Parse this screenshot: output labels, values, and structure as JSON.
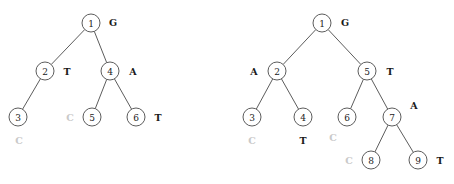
{
  "figure": {
    "colors": {
      "stroke": "#4a4a4a",
      "node_fill": "#ffffff",
      "label_dark": "#1a1a1a",
      "label_light": "#c9c9c9",
      "background": "#ffffff"
    },
    "node_radius": 9
  },
  "chart_data": {
    "type": "diagram",
    "title": "",
    "trees": [
      {
        "name": "left-tree",
        "nodes": [
          {
            "id": "1",
            "x": 91,
            "y": 23,
            "label": "G",
            "label_x": 113,
            "label_y": 22,
            "label_color": "dark"
          },
          {
            "id": "2",
            "x": 45,
            "y": 71,
            "label": "T",
            "label_x": 67,
            "label_y": 71,
            "label_color": "dark"
          },
          {
            "id": "4",
            "x": 110,
            "y": 71,
            "label": "A",
            "label_x": 133,
            "label_y": 71,
            "label_color": "dark"
          },
          {
            "id": "3",
            "x": 18,
            "y": 117,
            "label": "C",
            "label_x": 19,
            "label_y": 140,
            "label_color": "light"
          },
          {
            "id": "5",
            "x": 92,
            "y": 117,
            "label": "C",
            "label_x": 70,
            "label_y": 117,
            "label_color": "light"
          },
          {
            "id": "6",
            "x": 136,
            "y": 117,
            "label": "T",
            "label_x": 158,
            "label_y": 117,
            "label_color": "dark"
          }
        ],
        "edges": [
          {
            "from": "1",
            "to": "2"
          },
          {
            "from": "1",
            "to": "4"
          },
          {
            "from": "2",
            "to": "3"
          },
          {
            "from": "4",
            "to": "5"
          },
          {
            "from": "4",
            "to": "6"
          }
        ]
      },
      {
        "name": "right-tree",
        "nodes": [
          {
            "id": "1",
            "x": 322,
            "y": 23,
            "label": "G",
            "label_x": 345,
            "label_y": 22,
            "label_color": "dark"
          },
          {
            "id": "2",
            "x": 277,
            "y": 71,
            "label": "A",
            "label_x": 254,
            "label_y": 71,
            "label_color": "dark"
          },
          {
            "id": "5",
            "x": 367,
            "y": 71,
            "label": "T",
            "label_x": 390,
            "label_y": 71,
            "label_color": "dark"
          },
          {
            "id": "3",
            "x": 252,
            "y": 117,
            "label": "C",
            "label_x": 252,
            "label_y": 140,
            "label_color": "light"
          },
          {
            "id": "4",
            "x": 303,
            "y": 117,
            "label": "T",
            "label_x": 303,
            "label_y": 140,
            "label_color": "dark"
          },
          {
            "id": "6",
            "x": 347,
            "y": 117,
            "label": "C",
            "label_x": 333,
            "label_y": 137,
            "label_color": "light"
          },
          {
            "id": "7",
            "x": 392,
            "y": 117,
            "label": "A",
            "label_x": 414,
            "label_y": 105,
            "label_color": "dark"
          },
          {
            "id": "8",
            "x": 371,
            "y": 160,
            "label": "C",
            "label_x": 349,
            "label_y": 160,
            "label_color": "light"
          },
          {
            "id": "9",
            "x": 418,
            "y": 160,
            "label": "T",
            "label_x": 440,
            "label_y": 160,
            "label_color": "dark"
          }
        ],
        "edges": [
          {
            "from": "1",
            "to": "2"
          },
          {
            "from": "1",
            "to": "5"
          },
          {
            "from": "2",
            "to": "3"
          },
          {
            "from": "2",
            "to": "4"
          },
          {
            "from": "5",
            "to": "6"
          },
          {
            "from": "5",
            "to": "7"
          },
          {
            "from": "7",
            "to": "8"
          },
          {
            "from": "7",
            "to": "9"
          }
        ]
      }
    ]
  }
}
